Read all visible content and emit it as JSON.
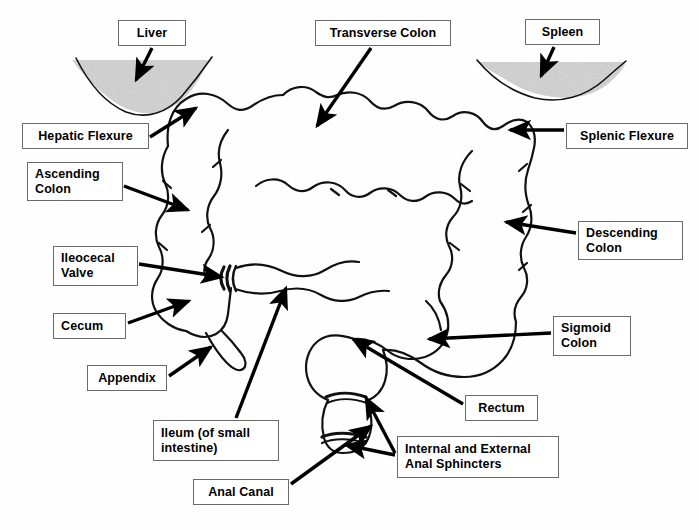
{
  "diagram": {
    "type": "anatomical-line-drawing",
    "background_color": "#fefefe",
    "outline_color": "#000000",
    "organ_shading_color": "#d2d2d2",
    "label_border_color": "#6a6a6a",
    "label_text_color": "#000000",
    "labels": [
      {
        "id": "liver",
        "text": "Liver",
        "x": 118,
        "y": 20,
        "w": 68,
        "h": 26,
        "align": "center"
      },
      {
        "id": "transverse-colon",
        "text": "Transverse Colon",
        "x": 315,
        "y": 20,
        "w": 136,
        "h": 26,
        "align": "center"
      },
      {
        "id": "spleen",
        "text": "Spleen",
        "x": 525,
        "y": 19,
        "w": 75,
        "h": 26,
        "align": "center"
      },
      {
        "id": "hepatic-flexure",
        "text": "Hepatic Flexure",
        "x": 22,
        "y": 123,
        "w": 127,
        "h": 26,
        "align": "center"
      },
      {
        "id": "splenic-flexure",
        "text": "Splenic Flexure",
        "x": 566,
        "y": 123,
        "w": 122,
        "h": 26,
        "align": "center"
      },
      {
        "id": "ascending-colon",
        "text": "Ascending\nColon",
        "x": 27,
        "y": 162,
        "w": 96,
        "h": 39,
        "align": "left"
      },
      {
        "id": "descending-colon",
        "text": "Descending\nColon",
        "x": 578,
        "y": 221,
        "w": 105,
        "h": 39,
        "align": "left"
      },
      {
        "id": "ileocecal-valve",
        "text": "Ileocecal\nValve",
        "x": 53,
        "y": 246,
        "w": 85,
        "h": 40,
        "align": "left"
      },
      {
        "id": "cecum",
        "text": "Cecum",
        "x": 53,
        "y": 313,
        "w": 73,
        "h": 26,
        "align": "left"
      },
      {
        "id": "sigmoid-colon",
        "text": "Sigmoid\nColon",
        "x": 553,
        "y": 316,
        "w": 78,
        "h": 40,
        "align": "left"
      },
      {
        "id": "appendix",
        "text": "Appendix",
        "x": 87,
        "y": 365,
        "w": 80,
        "h": 26,
        "align": "center"
      },
      {
        "id": "rectum",
        "text": "Rectum",
        "x": 465,
        "y": 395,
        "w": 73,
        "h": 26,
        "align": "center"
      },
      {
        "id": "ileum",
        "text": "Ileum (of small\nintestine)",
        "x": 153,
        "y": 420,
        "w": 126,
        "h": 41,
        "align": "left"
      },
      {
        "id": "anal-sphincters",
        "text": "Internal and External\nAnal Sphincters",
        "x": 397,
        "y": 436,
        "w": 162,
        "h": 42,
        "align": "left"
      },
      {
        "id": "anal-canal",
        "text": "Anal Canal",
        "x": 193,
        "y": 479,
        "w": 96,
        "h": 26,
        "align": "center"
      }
    ],
    "structures": [
      "liver-shadow",
      "spleen-shadow",
      "ascending-colon",
      "hepatic-flexure",
      "transverse-colon",
      "splenic-flexure",
      "descending-colon",
      "sigmoid-colon",
      "cecum",
      "appendix",
      "ileocecal-valve",
      "ileum",
      "rectum",
      "anal-canal",
      "anal-sphincter-bands"
    ],
    "pointers": [
      {
        "id": "liver-pointer",
        "from": [
          152,
          48
        ],
        "to": [
          136,
          82
        ]
      },
      {
        "id": "transverse-colon-pointer",
        "from": [
          371,
          48
        ],
        "to": [
          316,
          128
        ]
      },
      {
        "id": "spleen-pointer",
        "from": [
          554,
          47
        ],
        "to": [
          541,
          78
        ]
      },
      {
        "id": "hepatic-flexure-pointer",
        "from": [
          150,
          137
        ],
        "to": [
          196,
          107
        ]
      },
      {
        "id": "splenic-flexure-pointer",
        "from": [
          564,
          130
        ],
        "to": [
          508,
          130
        ]
      },
      {
        "id": "ascending-colon-pointer",
        "from": [
          124,
          186
        ],
        "to": [
          190,
          211
        ]
      },
      {
        "id": "descending-colon-pointer",
        "from": [
          576,
          233
        ],
        "to": [
          504,
          222
        ]
      },
      {
        "id": "ileocecal-valve-pointer",
        "from": [
          139,
          264
        ],
        "to": [
          225,
          277
        ]
      },
      {
        "id": "cecum-pointer",
        "from": [
          128,
          323
        ],
        "to": [
          190,
          300
        ]
      },
      {
        "id": "sigmoid-colon-pointer",
        "from": [
          551,
          333
        ],
        "to": [
          427,
          339
        ]
      },
      {
        "id": "appendix-pointer",
        "from": [
          169,
          376
        ],
        "to": [
          212,
          346
        ]
      },
      {
        "id": "rectum-pointer",
        "from": [
          463,
          404
        ],
        "to": [
          351,
          338
        ]
      },
      {
        "id": "ileum-pointer",
        "from": [
          236,
          418
        ],
        "to": [
          286,
          286
        ]
      },
      {
        "id": "anal-canal-pointer",
        "from": [
          291,
          484
        ],
        "to": [
          373,
          425
        ]
      },
      {
        "id": "sphincter-upper-pointer",
        "from": [
          395,
          455
        ],
        "to": [
          364,
          396
        ]
      },
      {
        "id": "sphincter-lower-pointer",
        "from": [
          395,
          455
        ],
        "to": [
          344,
          445
        ]
      }
    ]
  }
}
